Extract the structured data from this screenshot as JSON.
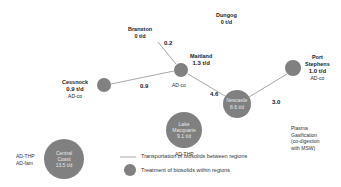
{
  "nodes": {
    "branxton": {
      "name": "Branxton",
      "amount": "0 t/d"
    },
    "dungog": {
      "name": "Dungog",
      "amount": "0 t/d"
    },
    "maitland": {
      "name": "Maitland",
      "amount": "1.3 t/d",
      "tech": "AD-co"
    },
    "cessnock": {
      "name": "Cessnock",
      "amount": "0.9 t/d",
      "tech": "AD-co"
    },
    "newcastle": {
      "name": "Newcastle",
      "amount": "8.6 t/d"
    },
    "port_stephens": {
      "name_line1": "Port",
      "name_line2": "Stephens",
      "amount": "1.0 t/d",
      "tech": "AD-co"
    },
    "lake_macquarie": {
      "name_line1": "Lake",
      "name_line2": "Macquarie",
      "amount": "9.1 t/d",
      "tech": "AD-THP"
    },
    "central_coast": {
      "name_line1": "Central",
      "name_line2": "Coast",
      "amount": "13.5 t/d",
      "tech_line1": "AD-THP",
      "tech_line2": "AD-fam"
    }
  },
  "flows": {
    "branxton_maitland": "0.2",
    "cessnock_maitland": "0.9",
    "maitland_newcastle": "4.6",
    "port_stephens_newcastle": "3.0"
  },
  "newcastle_tech": {
    "line1": "Plasma",
    "line2": "Gasification",
    "line3": "(co-digestion",
    "line4": "with MSW)"
  },
  "legend": {
    "transport": "Transportation of biosolids between regions",
    "treatment": "Treatment of biosolids within regions"
  },
  "colors": {
    "node": "#808080",
    "edge": "#a0a0a0"
  }
}
